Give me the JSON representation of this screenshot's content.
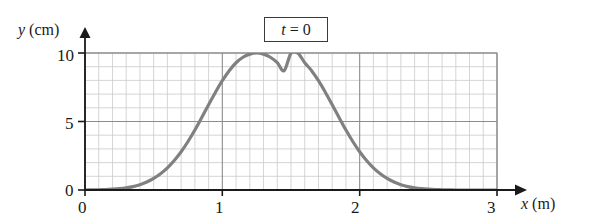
{
  "chart_data": {
    "type": "line",
    "title": "",
    "annotation": {
      "text_var": "t",
      "text_rest": " = 0",
      "full_text": "t = 0",
      "boxed": true
    },
    "xlabel_var": "x",
    "xlabel_unit": " (m)",
    "xlabel": "x (m)",
    "ylabel_var": "y",
    "ylabel_unit": " (cm)",
    "ylabel": "y (cm)",
    "xlim": [
      0,
      3
    ],
    "ylim": [
      0,
      10
    ],
    "xticks": [
      0,
      1,
      2,
      3
    ],
    "xtick_labels": [
      "0",
      "1",
      "2",
      "3"
    ],
    "yticks": [
      0,
      5,
      10
    ],
    "ytick_labels": [
      "0",
      "5",
      "10"
    ],
    "grid": true,
    "grid_minor_x_step": 0.1,
    "grid_minor_y_step": 1,
    "grid_major_x_step": 1,
    "grid_major_y_step": 5,
    "legend": null,
    "curve_color": "#808080",
    "curve_width_px": 3.2,
    "axis_color": "#1a1a1a",
    "grid_minor_color": "#c9c9c9",
    "grid_major_color": "#8a8a8a",
    "peak": {
      "x": 1.5,
      "y": 10
    },
    "x": [
      0.0,
      0.05,
      0.1,
      0.15,
      0.2,
      0.25,
      0.3,
      0.35,
      0.4,
      0.45,
      0.5,
      0.55,
      0.6,
      0.65,
      0.7,
      0.75,
      0.8,
      0.85,
      0.9,
      0.95,
      1.0,
      1.05,
      1.1,
      1.15,
      1.2,
      1.25,
      1.3,
      1.35,
      1.4,
      1.45,
      1.5,
      1.55,
      1.6,
      1.65,
      1.7,
      1.75,
      1.8,
      1.85,
      1.9,
      1.95,
      2.0,
      2.05,
      2.1,
      2.15,
      2.2,
      2.25,
      2.3,
      2.35,
      2.4,
      2.45,
      2.5,
      2.55,
      2.6,
      2.65,
      2.7,
      2.75,
      2.8,
      2.85,
      2.9,
      2.95,
      3.0
    ],
    "y": [
      0.0,
      0.01,
      0.02,
      0.03,
      0.06,
      0.1,
      0.16,
      0.25,
      0.39,
      0.58,
      0.84,
      1.18,
      1.61,
      2.15,
      2.79,
      3.54,
      4.38,
      5.29,
      6.22,
      7.14,
      7.98,
      8.71,
      9.29,
      9.69,
      9.92,
      10.0,
      9.92,
      9.69,
      9.29,
      8.71,
      9.99,
      9.99,
      9.29,
      8.71,
      7.98,
      7.14,
      6.22,
      5.29,
      4.38,
      3.54,
      2.79,
      2.15,
      1.61,
      1.18,
      0.84,
      0.58,
      0.39,
      0.25,
      0.16,
      0.1,
      0.06,
      0.03,
      0.02,
      0.01,
      0.0,
      0.0,
      0.0,
      0.0,
      0.0,
      0.0,
      0.0
    ]
  },
  "axes": {
    "y_label_var": "y",
    "y_label_unit": " (cm)",
    "x_label_var": "x",
    "x_label_unit": " (m)",
    "ytick_10": "10",
    "ytick_5": "5",
    "ytick_0": "0",
    "xtick_0": "0",
    "xtick_1": "1",
    "xtick_2": "2",
    "xtick_3": "3"
  },
  "annotation": {
    "var": "t",
    "rest": " = 0"
  }
}
